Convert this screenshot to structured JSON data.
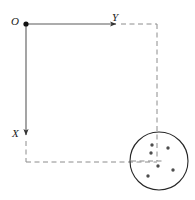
{
  "figure": {
    "background_color": "#ffffff",
    "width": 195,
    "height": 200,
    "labels": {
      "origin": "O",
      "y_axis": "Y",
      "x_axis": "X"
    },
    "colors": {
      "stroke": "#4d4d4d",
      "solid_axis": "#4d4d4d",
      "dashed_line": "#8c8c8c",
      "circle_outline": "#262626",
      "dot_fill": "#4d4d4d",
      "origin_dot": "#111111",
      "label_text": "#1a1a1a"
    },
    "origin_point": {
      "x": 26,
      "y": 24,
      "radius": 2.6
    },
    "axes": [
      {
        "name": "y-axis",
        "label": "Y",
        "orientation": "horizontal-right",
        "from": {
          "x": 26,
          "y": 24
        },
        "to": {
          "x": 121,
          "y": 24
        },
        "style": "solid",
        "arrow": true
      },
      {
        "name": "x-axis",
        "label": "X",
        "orientation": "vertical-down",
        "from": {
          "x": 26,
          "y": 24
        },
        "to": {
          "x": 26,
          "y": 141
        },
        "style": "solid",
        "arrow": true
      }
    ],
    "dashed_segments": [
      {
        "name": "top-dashed-extension",
        "x1": 121,
        "y1": 24,
        "x2": 157,
        "y2": 24
      },
      {
        "name": "right-dashed-vertical",
        "x1": 157,
        "y1": 24,
        "x2": 157,
        "y2": 161
      },
      {
        "name": "left-dashed-vertical",
        "x1": 26,
        "y1": 141,
        "x2": 26,
        "y2": 162
      },
      {
        "name": "bottom-dashed-horizontal",
        "x1": 26,
        "y1": 162,
        "x2": 157,
        "y2": 162
      },
      {
        "name": "circle-center-dashed-horizontal",
        "x1": 131,
        "y1": 161,
        "x2": 163,
        "y2": 161
      }
    ],
    "circle": {
      "name": "beam-cross-section",
      "center": {
        "x": 159,
        "y": 161
      },
      "radius": 29,
      "fill": "none",
      "stroke_width": 1.1
    },
    "dots": [
      {
        "id": 1,
        "x": 152,
        "y": 145,
        "r": 1.7
      },
      {
        "id": 2,
        "x": 151,
        "y": 153,
        "r": 1.7
      },
      {
        "id": 3,
        "x": 168,
        "y": 148,
        "r": 1.7
      },
      {
        "id": 4,
        "x": 158,
        "y": 166,
        "r": 1.7
      },
      {
        "id": 5,
        "x": 173,
        "y": 170,
        "r": 1.7
      },
      {
        "id": 6,
        "x": 148,
        "y": 176,
        "r": 1.7
      }
    ]
  }
}
